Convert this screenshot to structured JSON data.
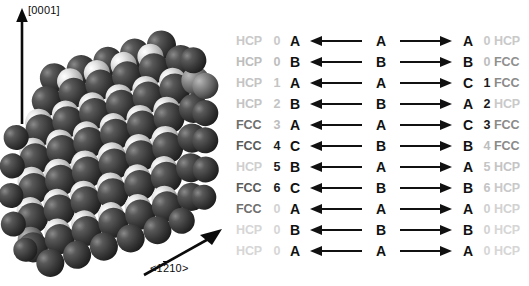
{
  "figure": {
    "crystal_model": {
      "name": "close-packed-sphere-stacking-model",
      "description": "Space-filling hard-sphere model of a close-packed slab viewed edge-on",
      "sphere_color_dark": "#3a3a3a",
      "sphere_color_light": "#d8d8d8",
      "background": "#ffffff"
    },
    "axes": [
      {
        "id": "c-axis",
        "label": "[0001]",
        "direction": "up"
      },
      {
        "id": "a-axis",
        "label_prefix": "<1",
        "label_overbar": "2",
        "label_suffix": "10>",
        "label_plain": "<1210>",
        "direction": "up-right"
      }
    ]
  },
  "stacking_table": {
    "columns": [
      "left_phase",
      "left_index",
      "left_layer",
      "left_arrow",
      "mid_layer",
      "right_arrow",
      "right_layer",
      "right_index",
      "right_phase"
    ],
    "arrow_left_glyph": "left-arrow",
    "arrow_right_glyph": "right-arrow",
    "rows": [
      {
        "left_phase": "HCP",
        "left_index": "0",
        "left_layer": "A",
        "mid_layer": "A",
        "right_layer": "A",
        "right_index": "0",
        "right_phase": "HCP",
        "lp_shade": "#c9c9c9",
        "li_shade": "#c9c9c9",
        "ri_shade": "#c9c9c9",
        "rp_shade": "#c9c9c9"
      },
      {
        "left_phase": "HCP",
        "left_index": "0",
        "left_layer": "B",
        "mid_layer": "B",
        "right_layer": "B",
        "right_index": "0",
        "right_phase": "FCC",
        "lp_shade": "#bdbdbd",
        "li_shade": "#bdbdbd",
        "ri_shade": "#bdbdbd",
        "rp_shade": "#8f8f8f"
      },
      {
        "left_phase": "HCP",
        "left_index": "1",
        "left_layer": "A",
        "mid_layer": "A",
        "right_layer": "C",
        "right_index": "1",
        "right_phase": "FCC",
        "lp_shade": "#c4c4c4",
        "li_shade": "#c4c4c4",
        "ri_shade": "#1a1a1a",
        "rp_shade": "#8a8a8a"
      },
      {
        "left_phase": "HCP",
        "left_index": "2",
        "left_layer": "B",
        "mid_layer": "B",
        "right_layer": "A",
        "right_index": "2",
        "right_phase": "HCP",
        "lp_shade": "#c4c4c4",
        "li_shade": "#c4c4c4",
        "ri_shade": "#1a1a1a",
        "rp_shade": "#c9c9c9"
      },
      {
        "left_phase": "FCC",
        "left_index": "3",
        "left_layer": "A",
        "mid_layer": "A",
        "right_layer": "C",
        "right_index": "3",
        "right_phase": "FCC",
        "lp_shade": "#6e6e6e",
        "li_shade": "#bdbdbd",
        "ri_shade": "#1a1a1a",
        "rp_shade": "#8a8a8a"
      },
      {
        "left_phase": "FCC",
        "left_index": "4",
        "left_layer": "C",
        "mid_layer": "B",
        "right_layer": "B",
        "right_index": "4",
        "right_phase": "FCC",
        "lp_shade": "#5a5a5a",
        "li_shade": "#1a1a1a",
        "ri_shade": "#bdbdbd",
        "rp_shade": "#8a8a8a"
      },
      {
        "left_phase": "HCP",
        "left_index": "5",
        "left_layer": "B",
        "mid_layer": "A",
        "right_layer": "A",
        "right_index": "5",
        "right_phase": "HCP",
        "lp_shade": "#cfcfcf",
        "li_shade": "#1a1a1a",
        "ri_shade": "#c4c4c4",
        "rp_shade": "#c4c4c4"
      },
      {
        "left_phase": "FCC",
        "left_index": "6",
        "left_layer": "C",
        "mid_layer": "B",
        "right_layer": "B",
        "right_index": "6",
        "right_phase": "HCP",
        "lp_shade": "#5a5a5a",
        "li_shade": "#1a1a1a",
        "ri_shade": "#c4c4c4",
        "rp_shade": "#c9c9c9"
      },
      {
        "left_phase": "FCC",
        "left_index": "0",
        "left_layer": "A",
        "mid_layer": "A",
        "right_layer": "A",
        "right_index": "0",
        "right_phase": "HCP",
        "lp_shade": "#6e6e6e",
        "li_shade": "#d2d2d2",
        "ri_shade": "#cfcfcf",
        "rp_shade": "#d2d2d2"
      },
      {
        "left_phase": "HCP",
        "left_index": "0",
        "left_layer": "B",
        "mid_layer": "B",
        "right_layer": "B",
        "right_index": "0",
        "right_phase": "HCP",
        "lp_shade": "#d6d6d6",
        "li_shade": "#d6d6d6",
        "ri_shade": "#d2d2d2",
        "rp_shade": "#d6d6d6"
      },
      {
        "left_phase": "HCP",
        "left_index": "0",
        "left_layer": "A",
        "mid_layer": "A",
        "right_layer": "A",
        "right_index": "0",
        "right_phase": "HCP",
        "lp_shade": "#d6d6d6",
        "li_shade": "#d6d6d6",
        "ri_shade": "#d6d6d6",
        "rp_shade": "#d6d6d6"
      }
    ]
  }
}
